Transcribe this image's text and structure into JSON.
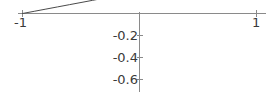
{
  "chart_data": {
    "type": "line",
    "title": "",
    "subtitle": "",
    "xlabel": "",
    "ylabel": "",
    "xlim": [
      -1.0,
      1.0
    ],
    "ylim": [
      -0.72,
      0.0
    ],
    "grid": false,
    "legend": null,
    "legend_position": "none",
    "x_ticks": [
      {
        "value": -1,
        "label": "-1"
      },
      {
        "value": 1,
        "label": "1"
      }
    ],
    "y_ticks": [
      {
        "value": -0.2,
        "label": "-0.2"
      },
      {
        "value": -0.4,
        "label": "-0.4"
      },
      {
        "value": -0.6,
        "label": "-0.6"
      }
    ],
    "axes": {
      "x_axis_at_y": 0,
      "y_axis_at_x": 0,
      "x_axis_drawn_range": [
        -1.05,
        1.07
      ],
      "y_axis_drawn_range": [
        -0.72,
        0.02
      ]
    },
    "series": [
      {
        "name": "curve",
        "color": "#4a4a4a",
        "x": [
          -1.0,
          -0.9,
          -0.8,
          -0.7,
          -0.6,
          -0.5,
          -0.4,
          -0.3,
          -0.2,
          -0.1,
          0.0,
          0.1,
          0.2,
          0.3,
          0.4,
          0.5,
          0.6,
          0.7,
          0.8,
          0.9,
          1.0
        ],
        "y": [
          0.0,
          -0.02,
          -0.04,
          -0.06,
          -0.08,
          -0.1,
          -0.12,
          -0.14,
          -0.16,
          -0.18,
          -0.2,
          -0.225,
          -0.25,
          -0.28,
          -0.315,
          -0.355,
          -0.4,
          -0.45,
          -0.51,
          -0.59,
          -0.71
        ]
      }
    ]
  },
  "labels": {
    "x_neg1": "-1",
    "x_pos1": "1",
    "y_m02": "-0.2",
    "y_m04": "-0.4",
    "y_m06": "-0.6"
  },
  "colors": {
    "curve": "#4a4a4a",
    "axis": "#8a8a8a",
    "text": "#3a3a3a",
    "background": "#ffffff"
  }
}
